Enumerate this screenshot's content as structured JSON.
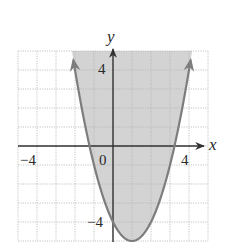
{
  "chart_data": {
    "type": "area",
    "title": "",
    "xlabel": "x",
    "ylabel": "y",
    "xlim": [
      -5,
      5
    ],
    "ylim": [
      -5,
      5
    ],
    "grid": true,
    "grid_step": 1,
    "x_ticks_labeled": [
      {
        "value": -4,
        "label": "−4"
      },
      {
        "value": 0,
        "label": "0"
      },
      {
        "value": 4,
        "label": "4"
      }
    ],
    "y_ticks_labeled": [
      {
        "value": 4,
        "label": "4"
      },
      {
        "value": -4,
        "label": "−4"
      }
    ],
    "series": [
      {
        "name": "y = (x - 1)^2 - 5",
        "curve": "parabola",
        "vertex": [
          1,
          -5
        ],
        "y_intercept": [
          0,
          -4
        ],
        "x_intercepts": [
          -1.24,
          3.24
        ],
        "arrows_at_ends": true,
        "shaded_region": "above curve",
        "boundary_style": "solid",
        "points": [
          [
            -2.16,
            5
          ],
          [
            -2,
            4
          ],
          [
            -1.5,
            1.25
          ],
          [
            -1,
            -1
          ],
          [
            -0.5,
            -2.75
          ],
          [
            0,
            -4
          ],
          [
            0.5,
            -4.75
          ],
          [
            1,
            -5
          ],
          [
            1.5,
            -4.75
          ],
          [
            2,
            -4
          ],
          [
            2.5,
            -2.75
          ],
          [
            3,
            -1
          ],
          [
            3.5,
            1.25
          ],
          [
            4,
            4
          ],
          [
            4.16,
            5
          ]
        ]
      }
    ],
    "colors": {
      "shade": "#d3d3d3",
      "curve": "#7d7d7d",
      "axes": "#333333",
      "grid": "#b5b5b5"
    }
  },
  "labels": {
    "x_axis": "x",
    "y_axis": "y",
    "x_tick_neg4": "−4",
    "x_tick_0": "0",
    "x_tick_4": "4",
    "y_tick_4": "4",
    "y_tick_neg4": "−4"
  }
}
